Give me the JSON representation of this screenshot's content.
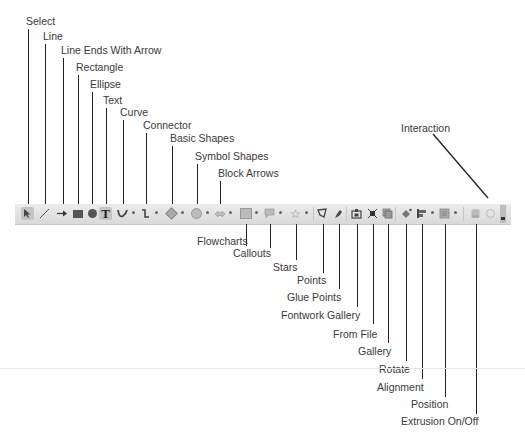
{
  "diagram": {
    "toolbar_name": "Drawing toolbar",
    "labels_above": [
      {
        "id": "select",
        "label": "Select"
      },
      {
        "id": "line",
        "label": "Line"
      },
      {
        "id": "line_ends_with_arrow",
        "label": "Line Ends With Arrow"
      },
      {
        "id": "rectangle",
        "label": "Rectangle"
      },
      {
        "id": "ellipse",
        "label": "Ellipse"
      },
      {
        "id": "text",
        "label": "Text"
      },
      {
        "id": "curve",
        "label": "Curve"
      },
      {
        "id": "connector",
        "label": "Connector"
      },
      {
        "id": "basic_shapes",
        "label": "Basic Shapes"
      },
      {
        "id": "symbol_shapes",
        "label": "Symbol Shapes"
      },
      {
        "id": "block_arrows",
        "label": "Block Arrows"
      },
      {
        "id": "interaction",
        "label": "Interaction"
      }
    ],
    "labels_below": [
      {
        "id": "flowcharts",
        "label": "Flowcharts"
      },
      {
        "id": "callouts",
        "label": "Callouts"
      },
      {
        "id": "stars",
        "label": "Stars"
      },
      {
        "id": "points",
        "label": "Points"
      },
      {
        "id": "glue_points",
        "label": "Glue Points"
      },
      {
        "id": "fontwork_gallery",
        "label": "Fontwork Gallery"
      },
      {
        "id": "from_file",
        "label": "From File"
      },
      {
        "id": "gallery",
        "label": "Gallery"
      },
      {
        "id": "rotate",
        "label": "Rotate"
      },
      {
        "id": "alignment",
        "label": "Alignment"
      },
      {
        "id": "position",
        "label": "Position"
      },
      {
        "id": "extrusion_on_off",
        "label": "Extrusion On/Off"
      }
    ]
  },
  "toolbar": {
    "icons": {
      "select": "select-arrow-icon",
      "line": "line-icon",
      "line_arrow": "line-arrow-icon",
      "rectangle": "rectangle-icon",
      "ellipse": "ellipse-icon",
      "text": "T",
      "curve": "curve-icon",
      "connector": "connector-icon",
      "basic_shapes": "diamond-icon",
      "symbol_shapes": "smiley-icon",
      "block_arrows": "block-arrow-icon",
      "flowcharts": "flowchart-icon",
      "callouts": "callout-icon",
      "stars": "☆",
      "points": "points-icon",
      "glue_points": "glue-points-icon",
      "fontwork": "fontwork-icon",
      "from_file": "image-from-file-icon",
      "gallery": "gallery-icon",
      "rotate": "rotate-icon",
      "alignment": "alignment-icon",
      "position": "position-icon",
      "extrusion": "extrusion-icon",
      "interaction": "interaction-icon"
    },
    "active_items": [
      "select",
      "text"
    ]
  }
}
